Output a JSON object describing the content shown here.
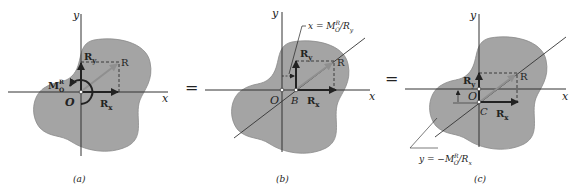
{
  "colors": {
    "blob": "#a4a4a4",
    "blob_stroke": "#8a8a8a",
    "axis": "#333333",
    "arrow": "#222222",
    "resultant": "#8f8f8f",
    "text": "#222222"
  },
  "panels": [
    {
      "id": "a",
      "caption": "(a)",
      "axis_x": "x",
      "axis_y": "y",
      "origin": "O",
      "labels": {
        "Ry": "R",
        "Ry_sub": "y",
        "Rx": "R",
        "Rx_sub": "x",
        "R": "R",
        "M": "M",
        "M_sup": "R",
        "M_sub": "O"
      }
    },
    {
      "id": "b",
      "caption": "(b)",
      "axis_x": "x",
      "axis_y": "y",
      "origin": "O",
      "point": "B",
      "labels": {
        "Ry": "R",
        "Ry_sub": "y",
        "Rx": "R",
        "Rx_sub": "x",
        "R": "R"
      },
      "annotation": "x = M",
      "annotation_sup": "R",
      "annotation_sub": "O",
      "annotation_tail": "/R",
      "annotation_tail_sub": "y"
    },
    {
      "id": "c",
      "caption": "(c)",
      "axis_x": "x",
      "axis_y": "y",
      "origin": "O",
      "point": "C",
      "labels": {
        "Ry": "R",
        "Ry_sub": "y",
        "Rx": "R",
        "Rx_sub": "x",
        "R": "R"
      },
      "annotation": "y = −M",
      "annotation_sup": "R",
      "annotation_sub": "O",
      "annotation_tail": "/R",
      "annotation_tail_sub": "x"
    }
  ],
  "equals": [
    "=",
    "="
  ]
}
